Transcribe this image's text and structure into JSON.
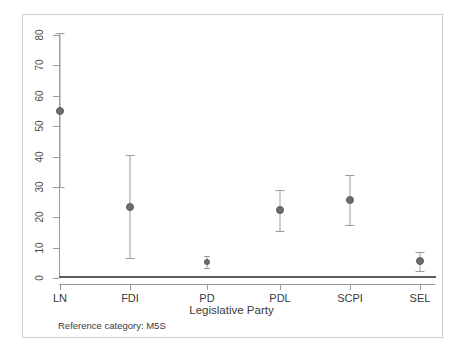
{
  "figure": {
    "background": "#ffffff",
    "frame_color": "#cfcfcf",
    "axis_color": "#9a9a9a",
    "point_color": "#6e6e6e",
    "errorbar_color": "#9b9b9b",
    "zero_line_color": "#5e5e5e"
  },
  "footnote": {
    "text": "Reference category: M5S"
  },
  "chart_data": {
    "type": "scatter",
    "title": "",
    "subtitle": "",
    "xlabel": "Legislative Party",
    "ylabel": "",
    "grid": false,
    "legend": "none",
    "annotations": [
      "Reference category: M5S"
    ],
    "zero_reference_line": 0,
    "xlim": [
      0,
      7
    ],
    "ylim": [
      0,
      83
    ],
    "ytick_labels": [
      "0",
      "10",
      "20",
      "30",
      "40",
      "50",
      "60",
      "70",
      "80"
    ],
    "yticks": [
      0,
      10,
      20,
      30,
      40,
      50,
      60,
      70,
      80
    ],
    "categories": [
      "LN",
      "FDI",
      "PD",
      "PDL",
      "SCPI",
      "SEL"
    ],
    "values": [
      55.0,
      23.4,
      5.3,
      22.4,
      25.7,
      5.6
    ],
    "ci_lower": [
      30.0,
      6.6,
      3.3,
      15.5,
      17.4,
      2.3
    ],
    "ci_upper": [
      80.5,
      40.5,
      7.2,
      29.0,
      33.9,
      8.6
    ],
    "series": [
      {
        "name": "Estimate with 95% CI",
        "points": [
          {
            "category": "LN",
            "value": 55.0,
            "ci_lower": 30.0,
            "ci_upper": 80.5
          },
          {
            "category": "FDI",
            "value": 23.4,
            "ci_lower": 6.6,
            "ci_upper": 40.5
          },
          {
            "category": "PD",
            "value": 5.3,
            "ci_lower": 3.3,
            "ci_upper": 7.2
          },
          {
            "category": "PDL",
            "value": 22.4,
            "ci_lower": 15.5,
            "ci_upper": 29.0
          },
          {
            "category": "SCPI",
            "value": 25.7,
            "ci_lower": 17.4,
            "ci_upper": 33.9
          },
          {
            "category": "SEL",
            "value": 5.6,
            "ci_lower": 2.3,
            "ci_upper": 8.6
          }
        ]
      }
    ]
  }
}
